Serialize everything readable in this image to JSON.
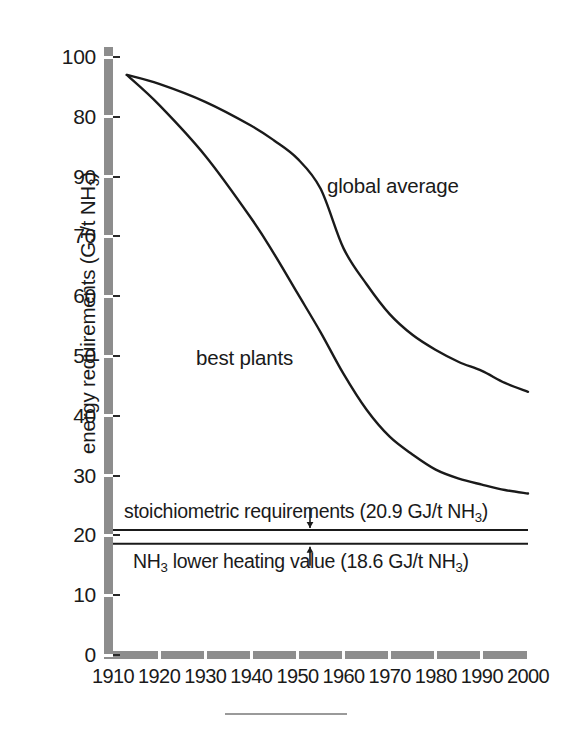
{
  "chart_data": {
    "type": "line",
    "title": "",
    "xlabel": "",
    "ylabel": "energy requirements (GJ/t NH3)",
    "ylabel_html": "energy requirements (GJ/t NH<sub>3</sub>)",
    "xlim": [
      1910,
      2000
    ],
    "ylim": [
      0,
      100
    ],
    "grid": false,
    "legend": "inline-curve-labels",
    "xticks": [
      1910,
      1920,
      1930,
      1940,
      1950,
      1960,
      1970,
      1980,
      1990,
      2000
    ],
    "xticklabels": [
      "1910",
      "1920",
      "1930",
      "1940",
      "1950",
      "1960",
      "1970",
      "1980",
      "1990",
      "2000"
    ],
    "ytick_values": [
      100,
      90,
      80,
      70,
      60,
      50,
      40,
      30,
      20,
      10,
      0
    ],
    "yticklabels": [
      "100",
      "80",
      "90",
      "70",
      "60",
      "50",
      "40",
      "30",
      "20",
      "10",
      "0"
    ],
    "ytick_label_note": "As printed, the 2nd and 3rd labels from the top read 80 then 90 (transposed in the original).",
    "series": [
      {
        "name": "global average",
        "x": [
          1913,
          1920,
          1930,
          1940,
          1945,
          1950,
          1955,
          1960,
          1965,
          1970,
          1975,
          1980,
          1985,
          1990,
          1995,
          2000
        ],
        "values": [
          97.0,
          95.5,
          92.5,
          88.5,
          86.0,
          83.0,
          78.0,
          68.0,
          62.0,
          57.0,
          53.5,
          51.0,
          49.0,
          47.5,
          45.5,
          44.0
        ]
      },
      {
        "name": "best plants",
        "x": [
          1913,
          1920,
          1930,
          1940,
          1945,
          1950,
          1955,
          1960,
          1965,
          1970,
          1975,
          1980,
          1985,
          1990,
          1995,
          2000
        ],
        "values": [
          97.0,
          92.0,
          83.5,
          73.0,
          67.0,
          60.5,
          54.0,
          47.0,
          41.0,
          36.5,
          33.5,
          31.0,
          29.5,
          28.5,
          27.6,
          27.0
        ]
      }
    ],
    "reference_lines": [
      {
        "name": "stoichiometric requirements",
        "value": 20.9,
        "label": "stoichiometric requirements (20.9 GJ/t NH3)",
        "label_html": "stoichiometric requirements (20.9 GJ/t NH<sub>3</sub>)",
        "label_position": "above",
        "arrow": "down"
      },
      {
        "name": "NH3 lower heating value",
        "value": 18.6,
        "label": "NH3 lower heating value (18.6 GJ/t NH3)",
        "label_html": "NH<sub>3</sub> lower heating value (18.6 GJ/t NH<sub>3</sub>)",
        "label_position": "below",
        "arrow": "up"
      }
    ],
    "colors": {
      "curve": "#1a1a1a",
      "axis": "#8d8d8d",
      "text": "#1a1a1a",
      "background": "#ffffff"
    }
  },
  "axis": {
    "y_title": "energy requirements (GJ/t NH",
    "y_title_sub": "3",
    "y_title_tail": ")"
  },
  "curve_labels": {
    "global_average": "global average",
    "best_plants": "best plants"
  },
  "annotations": {
    "stoichiometric": {
      "pre": "stoichiometric requirements (20.9 GJ/t NH",
      "sub": "3",
      "post": ")"
    },
    "lhv": {
      "lead": "NH",
      "lead_sub": "3",
      "mid": " lower heating value (18.6 GJ/t NH",
      "sub": "3",
      "post": ")"
    }
  }
}
